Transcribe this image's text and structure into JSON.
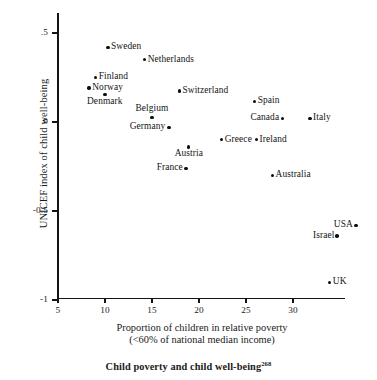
{
  "chart_data": {
    "type": "scatter",
    "title": "Child poverty and child well-being",
    "title_note": "268",
    "xlabel_line1": "Proportion of children in relative poverty",
    "xlabel_line2": "(<60% of national median income)",
    "ylabel": "UNICEF index of child well-being",
    "xlim": [
      5,
      30.8
    ],
    "ylim": [
      -1,
      0.61
    ],
    "xticks": [
      5,
      10,
      15,
      20,
      25,
      30
    ],
    "xtick_labels": [
      "5",
      "10",
      "15",
      "20",
      "25",
      "30"
    ],
    "yticks": [
      0.5,
      0,
      -0.5,
      -1
    ],
    "ytick_labels": [
      ".5",
      "0",
      "-0.5",
      "-1"
    ],
    "grid": false,
    "legend": "none",
    "points": [
      {
        "label": "Sweden",
        "x": 10.3,
        "y": 0.42,
        "label_pos": "right"
      },
      {
        "label": "Netherlands",
        "x": 14.2,
        "y": 0.35,
        "label_pos": "right"
      },
      {
        "label": "Finland",
        "x": 9.0,
        "y": 0.25,
        "label_pos": "right"
      },
      {
        "label": "Norway",
        "x": 8.3,
        "y": 0.19,
        "label_pos": "right"
      },
      {
        "label": "Denmark",
        "x": 10.0,
        "y": 0.155,
        "label_pos": "below"
      },
      {
        "label": "Switzerland",
        "x": 17.9,
        "y": 0.175,
        "label_pos": "right"
      },
      {
        "label": "Spain",
        "x": 25.9,
        "y": 0.115,
        "label_pos": "right"
      },
      {
        "label": "Belgium",
        "x": 15.0,
        "y": 0.025,
        "label_pos": "above"
      },
      {
        "label": "Canada",
        "x": 28.9,
        "y": 0.02,
        "label_pos": "left"
      },
      {
        "label": "Italy",
        "x": 31.8,
        "y": 0.02,
        "label_pos": "right"
      },
      {
        "label": "Germany",
        "x": 16.8,
        "y": -0.03,
        "label_pos": "left"
      },
      {
        "label": "Greece",
        "x": 22.4,
        "y": -0.1,
        "label_pos": "right"
      },
      {
        "label": "Ireland",
        "x": 26.1,
        "y": -0.1,
        "label_pos": "right"
      },
      {
        "label": "Austria",
        "x": 18.9,
        "y": -0.14,
        "label_pos": "below"
      },
      {
        "label": "France",
        "x": 18.6,
        "y": -0.26,
        "label_pos": "left"
      },
      {
        "label": "Australia",
        "x": 27.8,
        "y": -0.3,
        "label_pos": "right"
      },
      {
        "label": "USA",
        "x": 36.7,
        "y": -0.58,
        "label_pos": "left"
      },
      {
        "label": "Israel",
        "x": 34.7,
        "y": -0.64,
        "label_pos": "left"
      },
      {
        "label": "UK",
        "x": 33.9,
        "y": -0.9,
        "label_pos": "right"
      }
    ]
  }
}
